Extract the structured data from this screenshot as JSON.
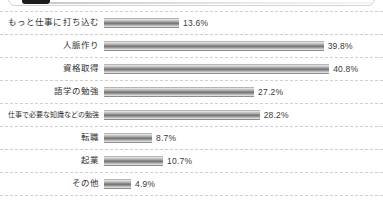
{
  "window": {
    "top_panel_visible": true,
    "tab_swatch_color": "#1d1d1d"
  },
  "chart_data": {
    "type": "bar",
    "orientation": "horizontal",
    "title": "",
    "xlabel": "",
    "ylabel": "",
    "xlim": [
      0,
      45
    ],
    "grid": false,
    "legend": "none",
    "unit": "%",
    "categories": [
      "もっと仕事に打ち込む",
      "人脈作り",
      "資格取得",
      "語学の勉強",
      "仕事で必要な知識などの勉強",
      "転職",
      "起業",
      "その他"
    ],
    "values": [
      13.6,
      39.8,
      40.8,
      27.2,
      28.2,
      8.7,
      10.7,
      4.9
    ],
    "value_labels": [
      "13.6%",
      "39.8%",
      "40.8%",
      "27.2%",
      "28.2%",
      "8.7%",
      "10.7%",
      "4.9%"
    ],
    "bar_color": "#7a7a7a"
  },
  "rows": [
    {
      "label": "もっと仕事に打ち込む",
      "value_label": "13.6%"
    },
    {
      "label": "人脈作り",
      "value_label": "39.8%"
    },
    {
      "label": "資格取得",
      "value_label": "40.8%"
    },
    {
      "label": "語学の勉強",
      "value_label": "27.2%"
    },
    {
      "label": "仕事で必要な知識などの勉強",
      "value_label": "28.2%"
    },
    {
      "label": "転職",
      "value_label": "8.7%"
    },
    {
      "label": "起業",
      "value_label": "10.7%"
    },
    {
      "label": "その他",
      "value_label": "4.9%"
    }
  ]
}
